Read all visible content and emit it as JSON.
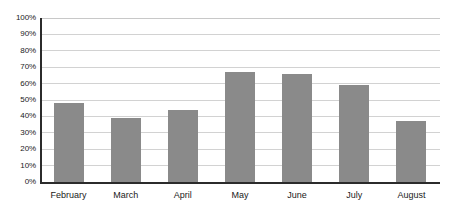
{
  "chart_data": {
    "type": "bar",
    "title": "",
    "subtitle": "",
    "xlabel": "",
    "ylabel": "",
    "categories": [
      "February",
      "March",
      "April",
      "May",
      "June",
      "July",
      "August"
    ],
    "values": [
      48,
      39,
      44,
      67,
      66,
      59,
      37
    ],
    "ylim": [
      0,
      100
    ],
    "y_ticks": [
      0,
      10,
      20,
      30,
      40,
      50,
      60,
      70,
      80,
      90,
      100
    ],
    "y_tick_labels": [
      "0%",
      "10%",
      "20%",
      "30%",
      "40%",
      "50%",
      "60%",
      "70%",
      "80%",
      "90%",
      "100%"
    ],
    "grid": true,
    "legend": false,
    "legend_position": "none",
    "series": [
      {
        "name": "",
        "values": [
          48,
          39,
          44,
          67,
          66,
          59,
          37
        ]
      }
    ],
    "colors": {
      "bar_fill": "#8a8a8a",
      "gridline": "#d2d2d2",
      "axis_line": "#2b2b2b",
      "tick_label": "#1a1a1a",
      "background": "#ffffff"
    }
  }
}
